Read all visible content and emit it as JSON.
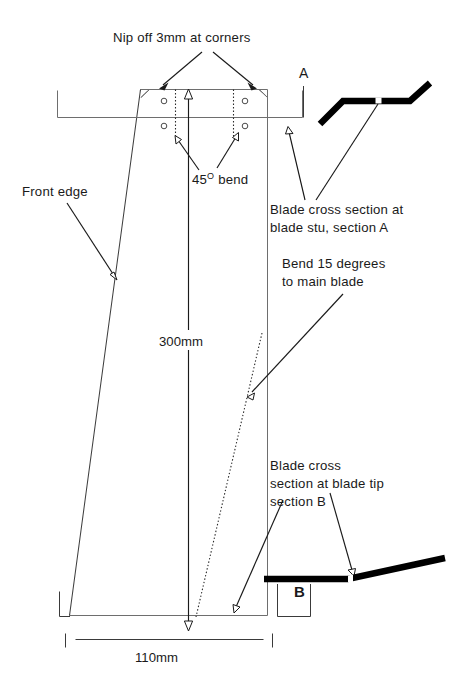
{
  "drawing": {
    "title_note": "Nip off 3mm at corners",
    "labels": {
      "front_edge": "Front edge",
      "bend_45_value": "45",
      "bend_45_degree": "O",
      "bend_45_word": " bend",
      "section_a_marker": "A",
      "section_b_marker": "B",
      "blade_cross_a_line1": "Blade cross section at",
      "blade_cross_a_line2": "blade stu, section A",
      "bend15_line1": "Bend 15 degrees",
      "bend15_line2": "to main blade",
      "blade_cross_b_line1": "Blade cross",
      "blade_cross_b_line2": "section at blade tip",
      "blade_cross_b_line3": "section B"
    },
    "dimensions": {
      "height": "300mm",
      "width": "110mm",
      "corner_nip": "3mm",
      "bend_angle_main": "45",
      "bend_angle_tip": "15"
    },
    "colors": {
      "background": "#ffffff",
      "outline": "#6e6e6e",
      "leader": "#1a1a1a",
      "blade_section": "#000000",
      "text": "#1a1a1a"
    },
    "parts": {
      "main_blade": "blade-outline",
      "holes_count": 4,
      "cross_section_a": "blade-cross-section-a",
      "cross_section_b": "blade-cross-section-b"
    }
  }
}
